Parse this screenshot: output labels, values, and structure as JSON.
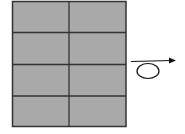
{
  "diagram": {
    "grid": {
      "columns": 2,
      "rows": 4,
      "cell_count": 8,
      "fill_color": "#a9a9a9",
      "line_color": "#333333"
    },
    "symbol": {
      "name": "loop-arrow",
      "direction": "right",
      "color": "#111111"
    }
  }
}
